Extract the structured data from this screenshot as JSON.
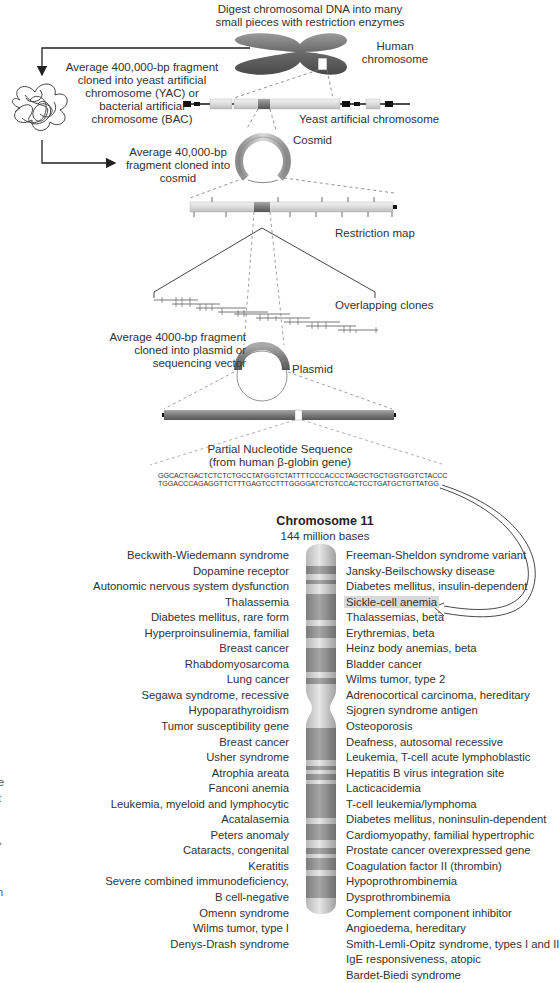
{
  "figure": {
    "top_caption": [
      "Digest chromosomal DNA into many",
      "small pieces with restriction enzymes"
    ],
    "human_chromosome_label": [
      "Human",
      "chromosome"
    ],
    "yac_step_label": [
      "Average 400,000-bp fragment",
      "cloned into yeast artificial",
      "chromosome (YAC) or",
      "bacterial artificial",
      "chromosome (BAC)"
    ],
    "yac_label": "Yeast artificial chromosome",
    "cosmid_step_label": [
      "Average 40,000-bp",
      "fragment cloned into",
      "cosmid"
    ],
    "cosmid_label": "Cosmid",
    "restriction_map_label": "Restriction map",
    "overlapping_clones_label": "Overlapping clones",
    "plasmid_step_label": [
      "Average 4000-bp fragment",
      "cloned into plasmid or",
      "sequencing vector"
    ],
    "plasmid_label": "Plasmid",
    "sequence_title": [
      "Partial Nucleotide Sequence",
      "(from human β-globin gene)"
    ],
    "sequence_lines": [
      "GGCACTGACTCTCTCTGCCTATGGTCTATTTTCCCACCCTAGGCTGCTGGTGGTCTACCC",
      "TGGACCCAGAGGTTCTTTGAGTCCTTTGGGGATCTGTCCACTCCTGATGCTGTTATGG"
    ],
    "colors": {
      "chromosome_dark": "#6e6e6e",
      "chromosome_light": "#d8d8d8",
      "highlight": "#d9d9d9",
      "line": "#333333"
    }
  },
  "chromosome": {
    "title": "Chromosome 11",
    "subtitle": "144 million bases",
    "left_loci": [
      "Beckwith-Wiedemann syndrome",
      "Dopamine receptor",
      "Autonomic nervous system dysfunction",
      "Thalassemia",
      "Diabetes mellitus, rare form",
      "Hyperproinsulinemia, familial",
      "Breast cancer",
      "Rhabdomyosarcoma",
      "Lung cancer",
      "Segawa syndrome, recessive",
      "Hypoparathyroidism",
      "Tumor susceptibility gene",
      "Breast cancer",
      "Usher syndrome",
      "Atrophia areata",
      "Fanconi anemia",
      "Leukemia, myeloid and lymphocytic",
      "Acatalasemia",
      "Peters anomaly",
      "Cataracts, congenital",
      "Keratitis",
      "Severe combined immunodeficiency,",
      "B cell-negative",
      "Omenn syndrome",
      "Wilms tumor, type I",
      "Denys-Drash syndrome"
    ],
    "right_loci": [
      "Freeman-Sheldon syndrome variant",
      "Jansky-Beilschowsky disease",
      "Diabetes mellitus, insulin-dependent",
      "Sickle-cell anemia",
      "Thalassemias, beta",
      "Erythremias, beta",
      "Heinz body anemias, beta",
      "Bladder cancer",
      "Wilms tumor, type 2",
      "Adrenocortical carcinoma, hereditary",
      "Sjogren syndrome antigen",
      "Osteoporosis",
      "Deafness, autosomal recessive",
      "Leukemia, T-cell acute lymphoblastic",
      "Hepatitis B virus integration site",
      "Lacticacidemia",
      "T-cell leukemia/lymphoma",
      "Diabetes mellitus, noninsulin-dependent",
      "Cardiomyopathy, familial hypertrophic",
      "Prostate cancer overexpressed gene",
      "Coagulation factor II (thrombin)",
      "Hypoprothrombinemia",
      "Dysprothrombinemia",
      "Complement component inhibitor",
      "Angioedema, hereditary",
      "Smith-Lemli-Opitz syndrome, types I and II",
      "IgE responsiveness, atopic",
      "Bardet-Biedi syndrome"
    ],
    "highlighted_locus": "Sickle-cell anemia"
  },
  "edge_fragments": [
    "e",
    "t",
    ",",
    "n"
  ]
}
